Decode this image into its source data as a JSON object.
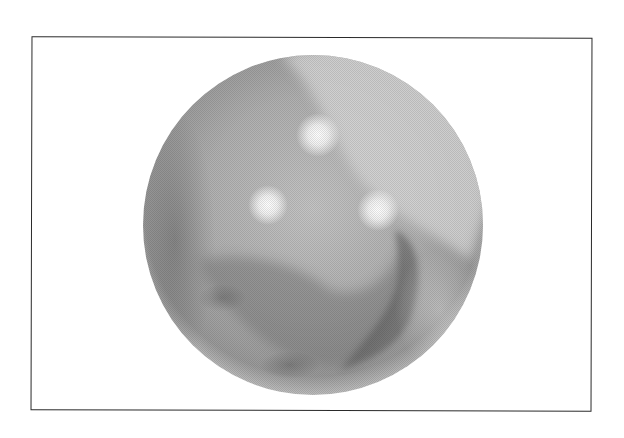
{
  "figure": {
    "frame": {
      "x": 31,
      "y": 37,
      "width": 561,
      "height": 374,
      "border_color": "#2a2a2a"
    },
    "sphere": {
      "cx": 313,
      "cy": 225,
      "r": 170,
      "base_color": "#a8a8a8",
      "edge_color": "#8c8c8c"
    },
    "highlights": [
      {
        "cx": 318,
        "cy": 135,
        "r": 16
      },
      {
        "cx": 268,
        "cy": 205,
        "r": 14
      },
      {
        "cx": 378,
        "cy": 210,
        "r": 15
      }
    ],
    "colors": {
      "background": "#ffffff",
      "light": "#e6e6e6",
      "mid": "#a8a8a8",
      "dark": "#6e6e6e"
    }
  }
}
